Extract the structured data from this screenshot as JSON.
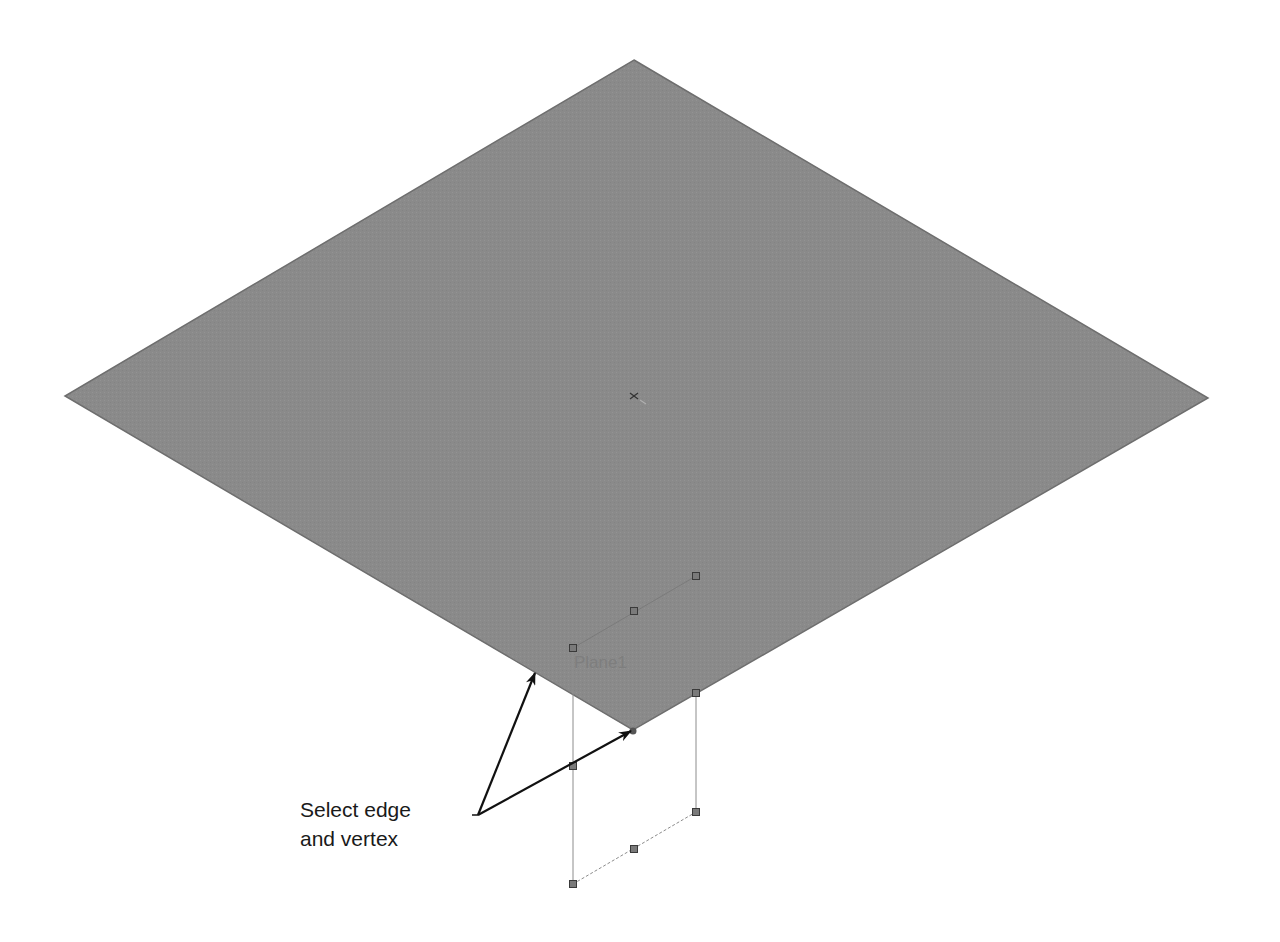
{
  "scene": {
    "plane_color": "#8a8a8a",
    "plane_edge_color": "#6e6e6e",
    "preview_line_color": "#8c8c8c",
    "handle_fill": "#7a7a7a",
    "handle_stroke": "#3a3a3a",
    "arrow_color": "#111111",
    "plane": {
      "top": [
        634,
        60
      ],
      "right": [
        1208,
        398
      ],
      "bottom": [
        633,
        730
      ],
      "left": [
        65,
        396
      ]
    },
    "origin_marker": [
      634,
      396
    ],
    "new_plane_label": "Plane1",
    "new_plane_label_pos": [
      574,
      668
    ],
    "handles": [
      [
        696,
        576
      ],
      [
        634,
        611
      ],
      [
        573,
        648
      ],
      [
        696,
        693
      ],
      [
        573,
        766
      ],
      [
        696,
        812
      ],
      [
        634,
        849
      ],
      [
        573,
        884
      ]
    ],
    "selected_vertex": [
      633,
      731
    ]
  },
  "callout": {
    "line1": "Select edge",
    "line2": "and vertex",
    "leader_start": [
      472,
      815
    ],
    "leader_corner": [
      478,
      815
    ],
    "arrow_targets": [
      [
        535,
        673
      ],
      [
        631,
        731
      ]
    ]
  }
}
